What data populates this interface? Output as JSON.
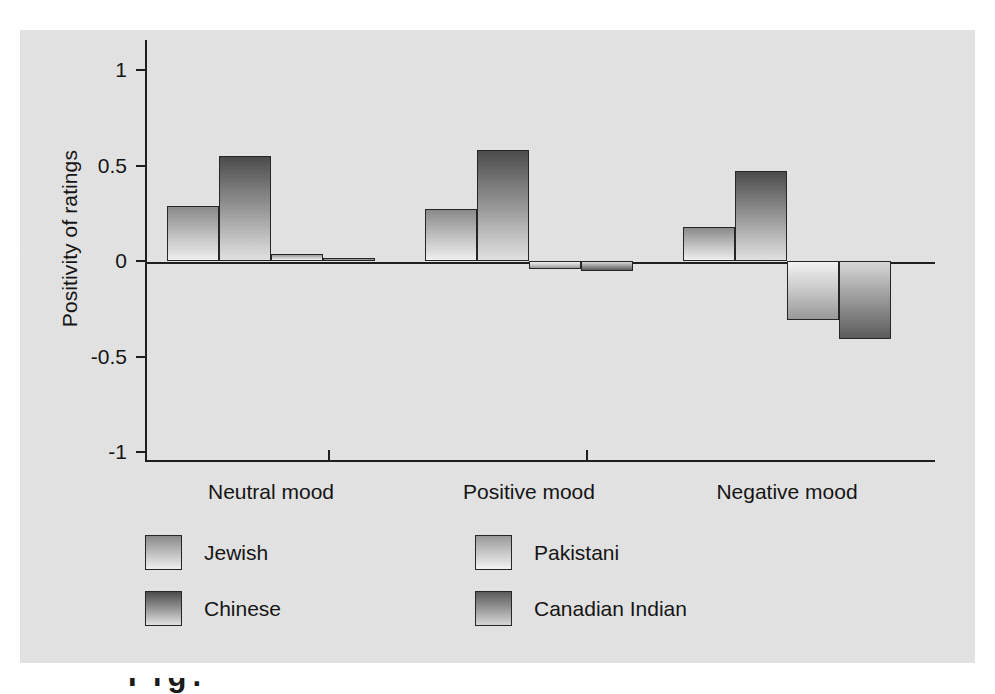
{
  "chart_data": {
    "type": "bar",
    "title": "",
    "xlabel": "",
    "ylabel": "Positivity of ratings",
    "categories": [
      "Neutral mood",
      "Positive mood",
      "Negative mood"
    ],
    "ylim": [
      -1,
      1
    ],
    "yticks": [
      "1",
      "0.5",
      "0",
      "-0.5",
      "-1"
    ],
    "ytick_values": [
      1,
      0.5,
      0,
      -0.5,
      -1
    ],
    "grid": false,
    "legend_position": "bottom",
    "zero_line": true,
    "series": [
      {
        "name": "Jewish",
        "values": [
          0.29,
          0.27,
          0.18
        ],
        "color_top": "#8a8a8a",
        "color_bottom": "#f2f2f2"
      },
      {
        "name": "Chinese",
        "values": [
          0.55,
          0.58,
          0.47
        ],
        "color_top": "#4a4a4a",
        "color_bottom": "#e3e3e3"
      },
      {
        "name": "Pakistani",
        "values": [
          0.035,
          -0.04,
          -0.31
        ],
        "color_top": "#9a9a9a",
        "color_bottom": "#f6f6f6"
      },
      {
        "name": "Canadian Indian",
        "values": [
          0.015,
          -0.05,
          -0.41
        ],
        "color_top": "#5a5a5a",
        "color_bottom": "#d8d8d8"
      }
    ]
  },
  "figure": {
    "background_color": "#e4e4e4",
    "axis_color": "#1c1c1c",
    "text_color": "#121212"
  },
  "caption_fragment": "Fig."
}
